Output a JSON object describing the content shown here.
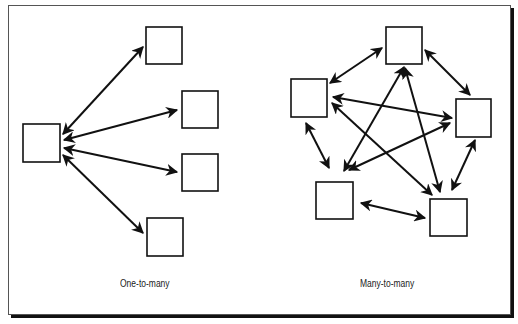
{
  "diagrams": [
    {
      "caption": "One-to-many",
      "nodes": [
        {
          "id": "hub",
          "x": 23,
          "y": 124,
          "w": 37,
          "h": 38
        },
        {
          "id": "n1",
          "x": 146,
          "y": 27,
          "w": 36,
          "h": 37
        },
        {
          "id": "n2",
          "x": 182,
          "y": 91,
          "w": 36,
          "h": 37
        },
        {
          "id": "n3",
          "x": 182,
          "y": 154,
          "w": 36,
          "h": 37
        },
        {
          "id": "n4",
          "x": 147,
          "y": 218,
          "w": 36,
          "h": 38
        }
      ],
      "edges": [
        [
          63,
          134,
          143,
          47
        ],
        [
          64,
          140,
          177,
          110
        ],
        [
          64,
          148,
          177,
          172
        ],
        [
          63,
          155,
          143,
          233
        ]
      ]
    },
    {
      "caption": "Many-to-many",
      "nodes": [
        {
          "id": "top",
          "x": 386,
          "y": 27,
          "w": 36,
          "h": 37
        },
        {
          "id": "left",
          "x": 291,
          "y": 79,
          "w": 36,
          "h": 38
        },
        {
          "id": "right",
          "x": 456,
          "y": 99,
          "w": 35,
          "h": 38
        },
        {
          "id": "bleft",
          "x": 316,
          "y": 182,
          "w": 37,
          "h": 37
        },
        {
          "id": "bright",
          "x": 430,
          "y": 199,
          "w": 37,
          "h": 37
        }
      ],
      "edges": [
        [
          330,
          83,
          382,
          48
        ],
        [
          425,
          50,
          470,
          95
        ],
        [
          475,
          140,
          452,
          190
        ],
        [
          361,
          203,
          425,
          218
        ],
        [
          306,
          123,
          329,
          168
        ],
        [
          333,
          97,
          452,
          118
        ],
        [
          332,
          103,
          432,
          195
        ],
        [
          404,
          67,
          344,
          171
        ],
        [
          405,
          68,
          440,
          192
        ],
        [
          349,
          170,
          450,
          123
        ]
      ]
    }
  ],
  "colors": {
    "stroke": "#111111",
    "background": "#ffffff",
    "frame": "#555555"
  }
}
